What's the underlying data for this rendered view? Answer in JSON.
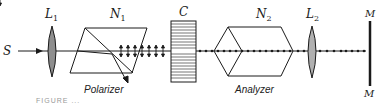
{
  "diagram": {
    "colors": {
      "ink": "#1a1a1a",
      "lens_fill": "#9a9a9a",
      "background": "#ffffff"
    },
    "source": {
      "label": "S"
    },
    "lens1": {
      "label": "L",
      "sub": "1"
    },
    "polarizer": {
      "label": "N",
      "sub": "1",
      "caption": "Polarizer"
    },
    "crystal": {
      "label": "C"
    },
    "analyzer": {
      "label": "N",
      "sub": "2",
      "caption": "Analyzer"
    },
    "lens2": {
      "label": "L",
      "sub": "2"
    },
    "screen": {
      "label_top": "M",
      "label_bottom": "M"
    },
    "figure_caption": "FIGURE ..."
  }
}
